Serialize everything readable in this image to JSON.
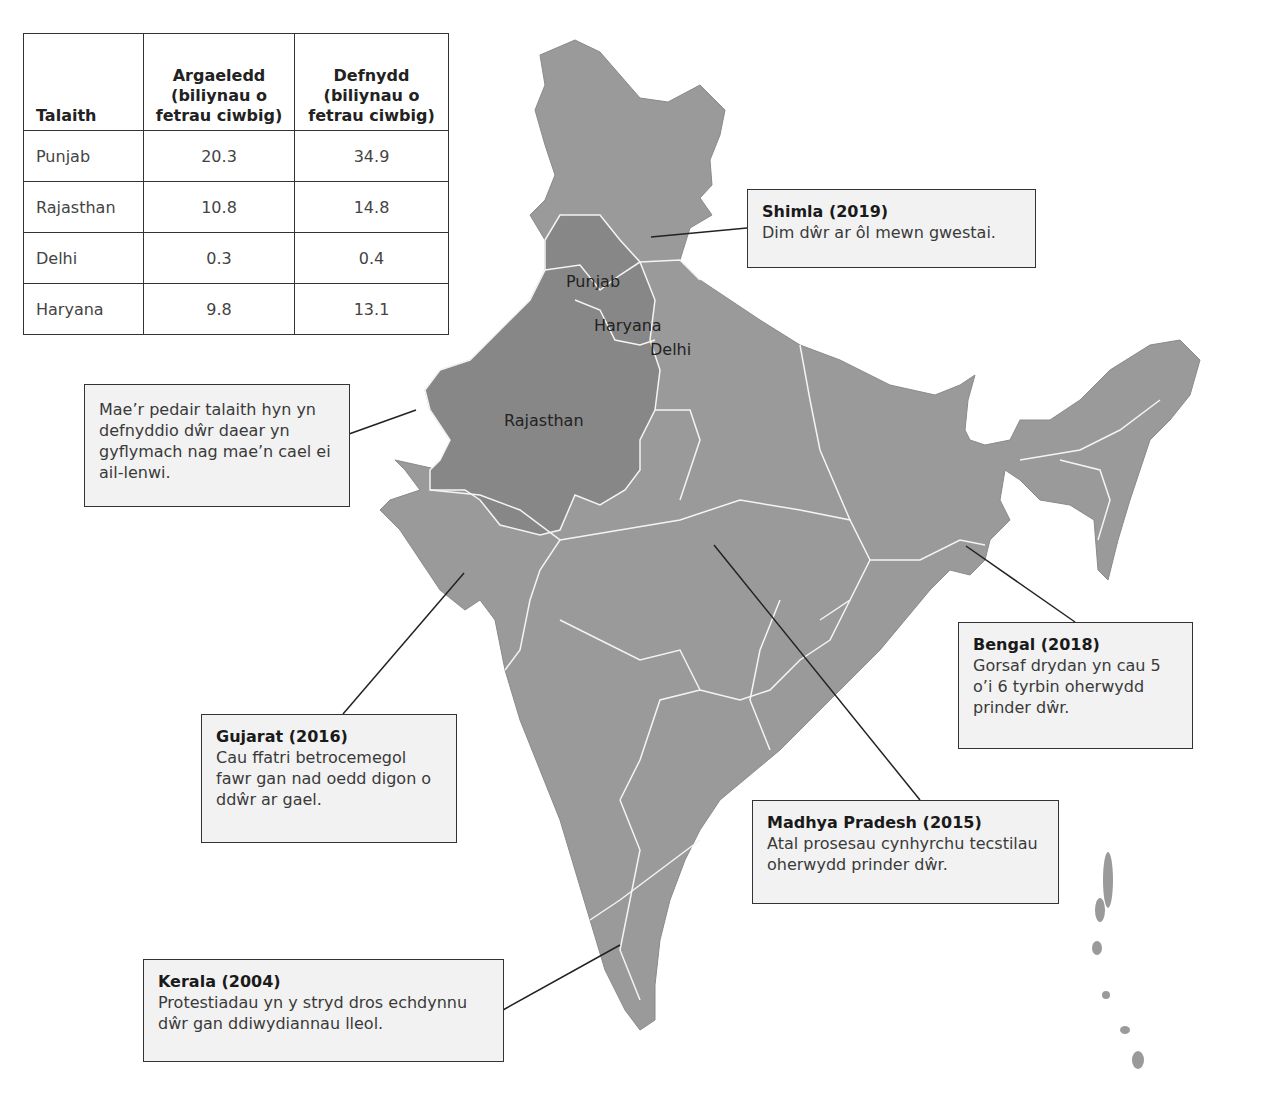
{
  "table": {
    "headers": [
      "Talaith",
      "Argaeledd (biliynau o fetrau ciwbig)",
      "Defnydd (biliynau o fetrau ciwbig)"
    ],
    "rows": [
      [
        "Punjab",
        "20.3",
        "34.9"
      ],
      [
        "Rajasthan",
        "10.8",
        "14.8"
      ],
      [
        "Delhi",
        "0.3",
        "0.4"
      ],
      [
        "Haryana",
        "9.8",
        "13.1"
      ]
    ]
  },
  "map": {
    "land_color": "#9a9a9a",
    "highlight_color": "#878787",
    "border_color": "#f4f4f4",
    "labels": {
      "punjab": "Punjab",
      "haryana": "Haryana",
      "delhi": "Delhi",
      "rajasthan": "Rajasthan"
    }
  },
  "callouts": {
    "groundwater": {
      "text": "Mae’r pedair talaith hyn yn defnyddio dŵr daear yn gyflymach nag mae’n cael ei ail-lenwi."
    },
    "shimla": {
      "title": "Shimla (2019)",
      "text": "Dim dŵr ar ôl mewn gwestai."
    },
    "bengal": {
      "title": "Bengal (2018)",
      "text": "Gorsaf drydan yn cau 5 o’i 6 tyrbin oherwydd prinder dŵr."
    },
    "gujarat": {
      "title": "Gujarat (2016)",
      "text": "Cau ffatri betrocemegol fawr gan nad oedd digon o ddŵr ar gael."
    },
    "madhya": {
      "title": "Madhya Pradesh (2015)",
      "text": "Atal prosesau cynhyrchu tecstilau oherwydd prinder dŵr."
    },
    "kerala": {
      "title": "Kerala (2004)",
      "text": "Protestiadau yn y stryd dros echdynnu dŵr gan ddiwydiannau lleol."
    }
  }
}
